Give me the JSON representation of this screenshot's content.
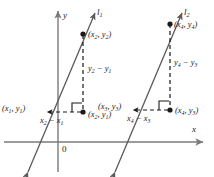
{
  "figure": {
    "type": "geometry-diagram",
    "axes": {
      "x_label": "x",
      "y_label": "y",
      "origin_label": "0"
    },
    "lines": [
      {
        "id": "l1",
        "label_html": "l<sub>1</sub>"
      },
      {
        "id": "l2",
        "label_html": "l<sub>2</sub>"
      }
    ],
    "points": [
      {
        "id": "p1",
        "label_html": "(x<sub>1</sub>, y<sub>1</sub>)"
      },
      {
        "id": "p2",
        "label_html": "(x<sub>2</sub>, y<sub>2</sub>)"
      },
      {
        "id": "p2a",
        "label_html": "(x<sub>2</sub>, y<sub>1</sub>)"
      },
      {
        "id": "p3",
        "label_html": "(x<sub>3</sub>, y<sub>3</sub>)"
      },
      {
        "id": "p4",
        "label_html": "(x<sub>4</sub>, y<sub>4</sub>)"
      },
      {
        "id": "p4a",
        "label_html": "(x<sub>4</sub>, y<sub>3</sub>)"
      }
    ],
    "segments": [
      {
        "id": "run1",
        "label_html": "x<sub>2</sub> &#8722; x<sub>1</sub>"
      },
      {
        "id": "rise1",
        "label_html": "y<sub>2</sub> &#8722; y<sub>1</sub>"
      },
      {
        "id": "run2",
        "label_html": "x<sub>4</sub> &#8722; x<sub>3</sub>"
      },
      {
        "id": "rise2",
        "label_html": "y<sub>4</sub> &#8722; y<sub>3</sub>"
      }
    ],
    "colors": {
      "axis": "#7a7a7a",
      "line": "#5a5a5a",
      "dashed": "#1a1a1a",
      "text": "#1a1a1a",
      "background": "#ffffff"
    }
  }
}
